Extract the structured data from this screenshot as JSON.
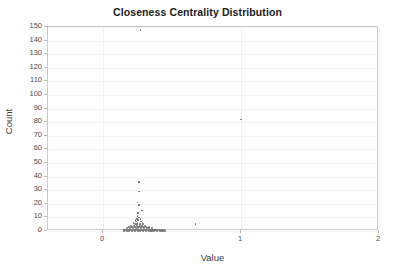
{
  "chart_data": {
    "type": "scatter",
    "title": "Closeness Centrality Distribution",
    "xlabel": "Value",
    "ylabel": "Count",
    "xlim": [
      -0.4,
      2.0
    ],
    "ylim": [
      0,
      150
    ],
    "xticks": [
      0,
      1,
      2
    ],
    "xtick_labels": [
      "0",
      "1",
      "2"
    ],
    "yticks": [
      0,
      10,
      20,
      30,
      40,
      50,
      60,
      70,
      80,
      90,
      100,
      110,
      120,
      130,
      140,
      150
    ],
    "ytick_labels": [
      "0",
      "10",
      "20",
      "30",
      "40",
      "50",
      "60",
      "70",
      "80",
      "90",
      "100",
      "110",
      "120",
      "130",
      "140",
      "150"
    ],
    "grid": true,
    "legend": "none",
    "marker_color": "#6f6f6f",
    "points": [
      {
        "x": 0.27,
        "y": 148
      },
      {
        "x": 1.0,
        "y": 82
      },
      {
        "x": 0.26,
        "y": 36
      },
      {
        "x": 0.26,
        "y": 29
      },
      {
        "x": 0.25,
        "y": 21
      },
      {
        "x": 0.26,
        "y": 19
      },
      {
        "x": 0.28,
        "y": 15
      },
      {
        "x": 0.255,
        "y": 13
      },
      {
        "x": 0.25,
        "y": 11
      },
      {
        "x": 0.26,
        "y": 10
      },
      {
        "x": 0.245,
        "y": 9
      },
      {
        "x": 0.27,
        "y": 9
      },
      {
        "x": 0.235,
        "y": 8
      },
      {
        "x": 0.255,
        "y": 8
      },
      {
        "x": 0.275,
        "y": 7
      },
      {
        "x": 0.24,
        "y": 7
      },
      {
        "x": 0.22,
        "y": 6
      },
      {
        "x": 0.25,
        "y": 6
      },
      {
        "x": 0.285,
        "y": 6
      },
      {
        "x": 0.23,
        "y": 5
      },
      {
        "x": 0.245,
        "y": 5
      },
      {
        "x": 0.265,
        "y": 5
      },
      {
        "x": 0.29,
        "y": 5
      },
      {
        "x": 0.67,
        "y": 5
      },
      {
        "x": 0.205,
        "y": 4
      },
      {
        "x": 0.225,
        "y": 4
      },
      {
        "x": 0.245,
        "y": 4
      },
      {
        "x": 0.265,
        "y": 4
      },
      {
        "x": 0.285,
        "y": 4
      },
      {
        "x": 0.305,
        "y": 4
      },
      {
        "x": 0.19,
        "y": 3
      },
      {
        "x": 0.21,
        "y": 3
      },
      {
        "x": 0.23,
        "y": 3
      },
      {
        "x": 0.25,
        "y": 3
      },
      {
        "x": 0.27,
        "y": 3
      },
      {
        "x": 0.29,
        "y": 3
      },
      {
        "x": 0.31,
        "y": 3
      },
      {
        "x": 0.33,
        "y": 3
      },
      {
        "x": 0.175,
        "y": 2
      },
      {
        "x": 0.195,
        "y": 2
      },
      {
        "x": 0.215,
        "y": 2
      },
      {
        "x": 0.235,
        "y": 2
      },
      {
        "x": 0.255,
        "y": 2
      },
      {
        "x": 0.275,
        "y": 2
      },
      {
        "x": 0.295,
        "y": 2
      },
      {
        "x": 0.315,
        "y": 2
      },
      {
        "x": 0.335,
        "y": 2
      },
      {
        "x": 0.355,
        "y": 2
      },
      {
        "x": 0.155,
        "y": 1
      },
      {
        "x": 0.17,
        "y": 1
      },
      {
        "x": 0.185,
        "y": 1
      },
      {
        "x": 0.2,
        "y": 1
      },
      {
        "x": 0.215,
        "y": 1
      },
      {
        "x": 0.23,
        "y": 1
      },
      {
        "x": 0.245,
        "y": 1
      },
      {
        "x": 0.26,
        "y": 1
      },
      {
        "x": 0.275,
        "y": 1
      },
      {
        "x": 0.29,
        "y": 1
      },
      {
        "x": 0.305,
        "y": 1
      },
      {
        "x": 0.32,
        "y": 1
      },
      {
        "x": 0.335,
        "y": 1
      },
      {
        "x": 0.35,
        "y": 1
      },
      {
        "x": 0.365,
        "y": 1
      },
      {
        "x": 0.38,
        "y": 1
      },
      {
        "x": 0.395,
        "y": 1
      },
      {
        "x": 0.41,
        "y": 1
      },
      {
        "x": 0.425,
        "y": 1
      },
      {
        "x": 0.44,
        "y": 1
      },
      {
        "x": 0.15,
        "y": 0
      },
      {
        "x": 0.17,
        "y": 0
      },
      {
        "x": 0.19,
        "y": 0
      },
      {
        "x": 0.21,
        "y": 0
      },
      {
        "x": 0.23,
        "y": 0
      },
      {
        "x": 0.25,
        "y": 0
      },
      {
        "x": 0.27,
        "y": 0
      },
      {
        "x": 0.29,
        "y": 0
      },
      {
        "x": 0.31,
        "y": 0
      },
      {
        "x": 0.33,
        "y": 0
      },
      {
        "x": 0.35,
        "y": 0
      },
      {
        "x": 0.37,
        "y": 0
      },
      {
        "x": 0.39,
        "y": 0
      },
      {
        "x": 0.41,
        "y": 0
      },
      {
        "x": 0.43,
        "y": 0
      },
      {
        "x": 0.45,
        "y": 0
      }
    ]
  }
}
